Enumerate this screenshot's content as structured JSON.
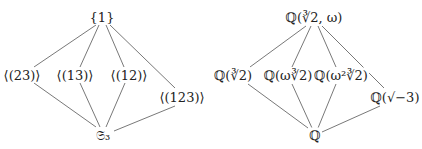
{
  "diagrams": [
    {
      "name": "subgroup-lattice",
      "nodes": [
        {
          "id": "top",
          "label": "{1}",
          "x": 102,
          "y": 17
        },
        {
          "id": "c23",
          "label": "⟨(23)⟩",
          "x": 22,
          "y": 75
        },
        {
          "id": "c13",
          "label": "⟨(13)⟩",
          "x": 75,
          "y": 75
        },
        {
          "id": "c12",
          "label": "⟨(12)⟩",
          "x": 129,
          "y": 75
        },
        {
          "id": "c123",
          "label": "⟨(123)⟩",
          "x": 182,
          "y": 97
        },
        {
          "id": "bottom",
          "label": "𝔖₃",
          "x": 103,
          "y": 135
        }
      ],
      "edges": [
        [
          "top",
          "c23"
        ],
        [
          "top",
          "c13"
        ],
        [
          "top",
          "c12"
        ],
        [
          "top",
          "c123"
        ],
        [
          "c23",
          "bottom"
        ],
        [
          "c13",
          "bottom"
        ],
        [
          "c12",
          "bottom"
        ],
        [
          "c123",
          "bottom"
        ]
      ]
    },
    {
      "name": "field-lattice",
      "nodes": [
        {
          "id": "top",
          "label": "ℚ(∛2, ω)",
          "x": 314,
          "y": 17
        },
        {
          "id": "f1",
          "label": "ℚ(∛2)",
          "x": 233,
          "y": 75
        },
        {
          "id": "f2",
          "label": "ℚ(ω∛2)",
          "x": 288,
          "y": 75
        },
        {
          "id": "f3",
          "label": "ℚ(ω²∛2)",
          "x": 341,
          "y": 75
        },
        {
          "id": "f4",
          "label": "ℚ(√−3)",
          "x": 395,
          "y": 97
        },
        {
          "id": "bottom",
          "label": "ℚ",
          "x": 315,
          "y": 135
        }
      ],
      "edges": [
        [
          "top",
          "f1"
        ],
        [
          "top",
          "f2"
        ],
        [
          "top",
          "f3"
        ],
        [
          "top",
          "f4"
        ],
        [
          "f1",
          "bottom"
        ],
        [
          "f2",
          "bottom"
        ],
        [
          "f3",
          "bottom"
        ],
        [
          "f4",
          "bottom"
        ]
      ]
    }
  ],
  "colors": {
    "line": "#555555",
    "text": "#222222"
  }
}
